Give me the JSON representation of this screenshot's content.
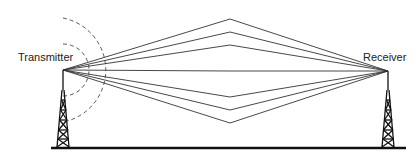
{
  "diagram": {
    "type": "multipath-propagation",
    "labels": {
      "transmitter": "Transmitter",
      "receiver": "Receiver"
    },
    "colors": {
      "line": "#333333",
      "ground": "#111111",
      "wave": "#444444"
    },
    "transmitter_point": [
      63,
      70
    ],
    "receiver_point": [
      388,
      71
    ],
    "path_apex_x": 230,
    "path_apex_y": [
      19,
      32,
      45,
      71,
      97,
      110,
      123
    ],
    "ground": {
      "y": 148,
      "x1": 51,
      "x2": 406
    }
  }
}
